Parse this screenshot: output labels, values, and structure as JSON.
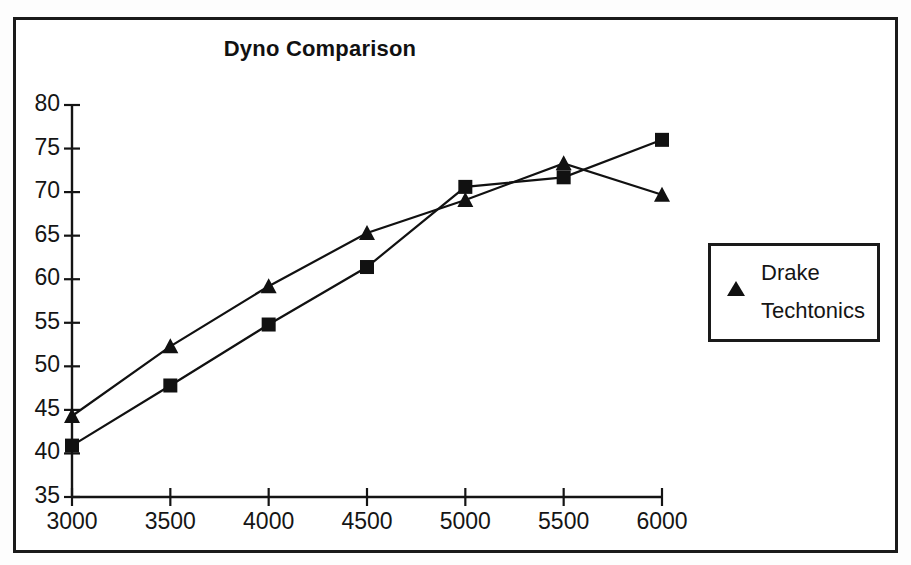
{
  "chart_data": {
    "type": "line",
    "title": "Dyno Comparison",
    "xlabel": "",
    "ylabel": "",
    "x": [
      3000,
      3500,
      4000,
      4500,
      5000,
      5500,
      6000
    ],
    "xtick_labels": [
      "3000",
      "3500",
      "4000",
      "4500",
      "5000",
      "5500",
      "6000"
    ],
    "ytick_labels": [
      "35",
      "40",
      "45",
      "50",
      "55",
      "60",
      "65",
      "70",
      "75",
      "80"
    ],
    "yticks": [
      35,
      40,
      45,
      50,
      55,
      60,
      65,
      70,
      75,
      80
    ],
    "xlim": [
      3000,
      6000
    ],
    "ylim": [
      35,
      80
    ],
    "grid": false,
    "legend_position": "right",
    "series": [
      {
        "name": "Drake",
        "marker": "triangle",
        "color": "#111111",
        "values": [
          44.3,
          52.3,
          59.2,
          65.3,
          69.1,
          73.3,
          69.7
        ]
      },
      {
        "name": "Techtonics",
        "marker": "square",
        "color": "#111111",
        "values": [
          40.9,
          47.8,
          54.8,
          61.4,
          70.6,
          71.7,
          76.0
        ]
      }
    ]
  },
  "legend": {
    "entries": [
      {
        "label": "Drake",
        "marker": "triangle"
      },
      {
        "label": "Techtonics",
        "marker": "square"
      }
    ]
  }
}
